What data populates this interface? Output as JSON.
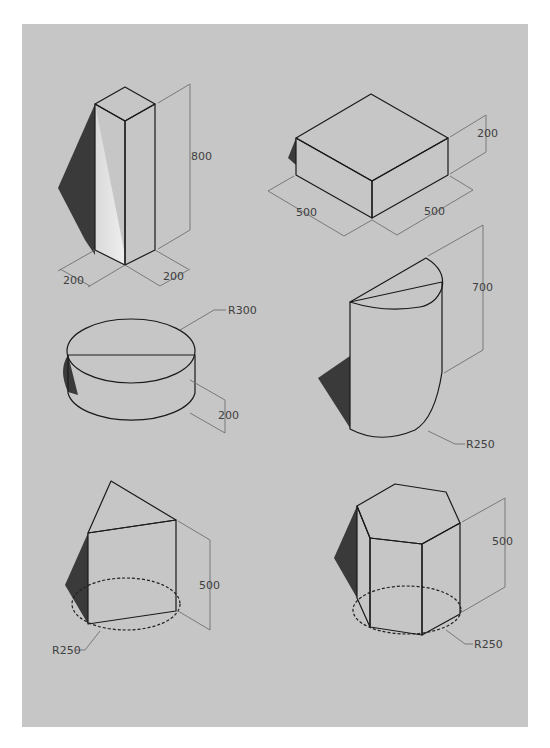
{
  "diagram": {
    "background_color": "#c6c6c6",
    "shapes": [
      {
        "id": "tall-square-prism",
        "type": "square prism",
        "dimensions": [
          {
            "label": "800"
          },
          {
            "label": "200"
          },
          {
            "label": "200"
          }
        ]
      },
      {
        "id": "flat-square-box",
        "type": "rectangular box",
        "dimensions": [
          {
            "label": "200"
          },
          {
            "label": "500"
          },
          {
            "label": "500"
          }
        ]
      },
      {
        "id": "short-cylinder",
        "type": "cylinder",
        "dimensions": [
          {
            "label": "R300"
          },
          {
            "label": "200"
          }
        ]
      },
      {
        "id": "half-cylinder",
        "type": "half cylinder",
        "dimensions": [
          {
            "label": "700"
          },
          {
            "label": "R250"
          }
        ]
      },
      {
        "id": "triangular-prism",
        "type": "triangular prism inscribed in circle",
        "dimensions": [
          {
            "label": "500"
          },
          {
            "label": "R250"
          }
        ]
      },
      {
        "id": "hexagonal-prism",
        "type": "hexagonal prism inscribed in circle",
        "dimensions": [
          {
            "label": "500"
          },
          {
            "label": "R250"
          }
        ]
      }
    ]
  }
}
